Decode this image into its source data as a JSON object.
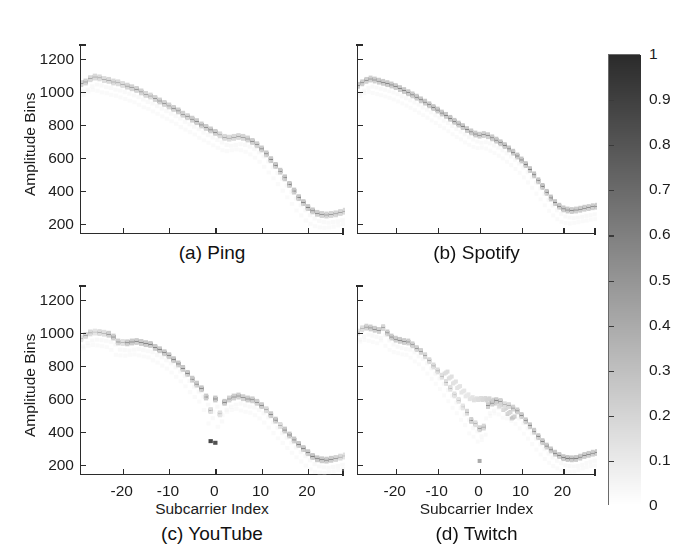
{
  "figure": {
    "width": 682,
    "height": 559,
    "background": "#ffffff",
    "ink_color": "#1c1c1c"
  },
  "panels": [
    {
      "id": "a",
      "caption": "(a) Ping",
      "ylabel": "Amplitude Bins",
      "xlabel": "",
      "show_ytick_labels": true,
      "show_xtick_labels": false
    },
    {
      "id": "b",
      "caption": "(b) Spotify",
      "ylabel": "",
      "xlabel": "",
      "show_ytick_labels": false,
      "show_xtick_labels": false
    },
    {
      "id": "c",
      "caption": "(c) YouTube",
      "ylabel": "Amplitude Bins",
      "xlabel": "Subcarrier Index",
      "show_ytick_labels": true,
      "show_xtick_labels": true
    },
    {
      "id": "d",
      "caption": "(d) Twitch",
      "ylabel": "",
      "xlabel": "Subcarrier Index",
      "show_ytick_labels": false,
      "show_xtick_labels": true
    }
  ],
  "colorbar": {
    "min_label": "0",
    "max_label": "1",
    "low_color": "#ffffff",
    "high_color": "#2f2f2f",
    "ticks": [
      "1",
      "0.9",
      "0.8",
      "0.7",
      "0.6",
      "0.5",
      "0.4",
      "0.3",
      "0.2",
      "0.1",
      "0"
    ],
    "tick_values": [
      1,
      0.9,
      0.8,
      0.7,
      0.6,
      0.5,
      0.4,
      0.3,
      0.2,
      0.1,
      0
    ]
  },
  "chart_data": {
    "type": "heatmap",
    "title": "",
    "xlabel": "Subcarrier Index",
    "ylabel": "Amplitude Bins",
    "xlim": [
      -29,
      28
    ],
    "ylim": [
      140,
      1290
    ],
    "xticks": [
      -20,
      -10,
      0,
      10,
      20
    ],
    "xticklabels": [
      "-20",
      "-10",
      "0",
      "10",
      "20"
    ],
    "yticks": [
      200,
      400,
      600,
      800,
      1000,
      1200
    ],
    "yticklabels": [
      "200",
      "400",
      "600",
      "800",
      "1000",
      "1200"
    ],
    "grid": false,
    "colormap": "gray-reversed",
    "clim": [
      0,
      1
    ],
    "colorbar_label": "",
    "legend_position": "right-colorbar",
    "panels": [
      {
        "id": "a",
        "name": "Ping",
        "x": [
          -29,
          -28,
          -27,
          -26,
          -25,
          -24,
          -23,
          -22,
          -21,
          -20,
          -19,
          -18,
          -17,
          -16,
          -15,
          -14,
          -13,
          -12,
          -11,
          -10,
          -9,
          -8,
          -7,
          -6,
          -5,
          -4,
          -3,
          -2,
          -1,
          0,
          1,
          2,
          3,
          4,
          5,
          6,
          7,
          8,
          9,
          10,
          11,
          12,
          13,
          14,
          15,
          16,
          17,
          18,
          19,
          20,
          21,
          22,
          23,
          24,
          25,
          26,
          27,
          28
        ],
        "y": [
          1050,
          1060,
          1080,
          1090,
          1085,
          1075,
          1070,
          1060,
          1055,
          1045,
          1035,
          1025,
          1015,
          1000,
          985,
          975,
          960,
          945,
          930,
          915,
          900,
          885,
          865,
          850,
          835,
          820,
          800,
          785,
          770,
          755,
          740,
          725,
          720,
          725,
          730,
          725,
          715,
          700,
          680,
          655,
          625,
          590,
          555,
          520,
          480,
          440,
          400,
          360,
          330,
          300,
          280,
          265,
          258,
          255,
          258,
          262,
          270,
          278
        ],
        "intensity": [
          0.72,
          0.7,
          0.62,
          0.6,
          0.58,
          0.55,
          0.62,
          0.6,
          0.58,
          0.55,
          0.68,
          0.7,
          0.72,
          0.7,
          0.65,
          0.62,
          0.72,
          0.75,
          0.72,
          0.7,
          0.75,
          0.78,
          0.75,
          0.72,
          0.8,
          0.82,
          0.8,
          0.78,
          0.82,
          0.8,
          0.62,
          0.6,
          0.58,
          0.6,
          0.62,
          0.66,
          0.72,
          0.78,
          0.8,
          0.82,
          0.85,
          0.88,
          0.86,
          0.88,
          0.9,
          0.88,
          0.9,
          0.88,
          0.86,
          0.88,
          0.86,
          0.8,
          0.72,
          0.7,
          0.68,
          0.66,
          0.64,
          0.62
        ]
      },
      {
        "id": "b",
        "name": "Spotify",
        "x": [
          -29,
          -28,
          -27,
          -26,
          -25,
          -24,
          -23,
          -22,
          -21,
          -20,
          -19,
          -18,
          -17,
          -16,
          -15,
          -14,
          -13,
          -12,
          -11,
          -10,
          -9,
          -8,
          -7,
          -6,
          -5,
          -4,
          -3,
          -2,
          -1,
          0,
          1,
          2,
          3,
          4,
          5,
          6,
          7,
          8,
          9,
          10,
          11,
          12,
          13,
          14,
          15,
          16,
          17,
          18,
          19,
          20,
          21,
          22,
          23,
          24,
          25,
          26,
          27,
          28
        ],
        "y": [
          1040,
          1055,
          1070,
          1078,
          1072,
          1065,
          1058,
          1050,
          1042,
          1032,
          1020,
          1008,
          995,
          982,
          968,
          952,
          938,
          922,
          905,
          890,
          872,
          858,
          840,
          822,
          805,
          790,
          772,
          758,
          745,
          738,
          742,
          735,
          722,
          708,
          692,
          675,
          655,
          635,
          612,
          588,
          560,
          530,
          498,
          462,
          428,
          392,
          358,
          330,
          308,
          292,
          285,
          282,
          285,
          290,
          296,
          300,
          305,
          308
        ],
        "intensity": [
          0.85,
          0.82,
          0.78,
          0.76,
          0.8,
          0.82,
          0.84,
          0.86,
          0.85,
          0.84,
          0.86,
          0.88,
          0.86,
          0.85,
          0.87,
          0.88,
          0.86,
          0.88,
          0.9,
          0.88,
          0.87,
          0.88,
          0.9,
          0.88,
          0.86,
          0.88,
          0.86,
          0.84,
          0.85,
          0.8,
          0.76,
          0.8,
          0.84,
          0.86,
          0.88,
          0.9,
          0.88,
          0.9,
          0.92,
          0.9,
          0.92,
          0.9,
          0.92,
          0.9,
          0.92,
          0.9,
          0.92,
          0.9,
          0.88,
          0.86,
          0.84,
          0.82,
          0.8,
          0.82,
          0.8,
          0.78,
          0.8,
          0.78
        ]
      },
      {
        "id": "c",
        "name": "YouTube",
        "x": [
          -29,
          -28,
          -27,
          -26,
          -25,
          -24,
          -23,
          -22,
          -21,
          -20,
          -19,
          -18,
          -17,
          -16,
          -15,
          -14,
          -13,
          -12,
          -11,
          -10,
          -9,
          -8,
          -7,
          -6,
          -5,
          -4,
          -3,
          -2,
          -1,
          0,
          1,
          2,
          3,
          4,
          5,
          6,
          7,
          8,
          9,
          10,
          11,
          12,
          13,
          14,
          15,
          16,
          17,
          18,
          19,
          20,
          21,
          22,
          23,
          24,
          25,
          26,
          27,
          28
        ],
        "y": [
          965,
          985,
          1000,
          1005,
          1002,
          998,
          992,
          975,
          945,
          942,
          940,
          945,
          948,
          942,
          935,
          930,
          912,
          898,
          880,
          862,
          838,
          812,
          785,
          755,
          720,
          690,
          662,
          612,
          530,
          600,
          510,
          580,
          600,
          612,
          618,
          608,
          600,
          595,
          580,
          560,
          535,
          505,
          472,
          440,
          412,
          382,
          352,
          325,
          300,
          275,
          252,
          238,
          232,
          230,
          235,
          240,
          248,
          255
        ],
        "intensity": [
          0.45,
          0.62,
          0.58,
          0.42,
          0.55,
          0.52,
          0.78,
          0.8,
          0.76,
          0.5,
          0.82,
          0.84,
          0.8,
          0.82,
          0.86,
          0.88,
          0.86,
          0.88,
          0.86,
          0.88,
          0.9,
          0.88,
          0.86,
          0.88,
          0.86,
          0.84,
          0.88,
          0.86,
          0.55,
          0.88,
          0.48,
          0.86,
          0.72,
          0.8,
          0.78,
          0.76,
          0.82,
          0.8,
          0.78,
          0.82,
          0.6,
          0.84,
          0.86,
          0.55,
          0.86,
          0.88,
          0.86,
          0.88,
          0.86,
          0.88,
          0.9,
          0.88,
          0.86,
          0.84,
          0.82,
          0.68,
          0.58,
          0.48
        ],
        "outlier_points": [
          {
            "x": -1,
            "y": 345,
            "intensity": 0.86
          },
          {
            "x": 0,
            "y": 335,
            "intensity": 0.82
          }
        ]
      },
      {
        "id": "d",
        "name": "Twitch",
        "x": [
          -29,
          -28,
          -27,
          -26,
          -25,
          -24,
          -23,
          -22,
          -21,
          -20,
          -19,
          -18,
          -17,
          -16,
          -15,
          -14,
          -13,
          -12,
          -11,
          -10,
          -9,
          -8,
          -7,
          -6,
          -5,
          -4,
          -3,
          -2,
          -1,
          0,
          1,
          2,
          3,
          4,
          5,
          6,
          7,
          8,
          9,
          10,
          11,
          12,
          13,
          14,
          15,
          16,
          17,
          18,
          19,
          20,
          21,
          22,
          23,
          24,
          25,
          26,
          27,
          28
        ],
        "y": [
          1005,
          1025,
          1035,
          1030,
          1022,
          1015,
          1032,
          1000,
          975,
          962,
          955,
          948,
          945,
          928,
          905,
          888,
          862,
          832,
          800,
          770,
          738,
          700,
          665,
          625,
          592,
          552,
          520,
          470,
          450,
          420,
          430,
          560,
          575,
          590,
          585,
          565,
          560,
          545,
          528,
          500,
          468,
          438,
          405,
          372,
          342,
          315,
          292,
          272,
          258,
          245,
          240,
          238,
          240,
          248,
          258,
          265,
          272,
          276
        ],
        "intensity": [
          0.42,
          0.52,
          0.7,
          0.78,
          0.8,
          0.75,
          0.65,
          0.82,
          0.84,
          0.8,
          0.82,
          0.8,
          0.78,
          0.75,
          0.72,
          0.7,
          0.65,
          0.62,
          0.58,
          0.55,
          0.5,
          0.52,
          0.48,
          0.45,
          0.42,
          0.4,
          0.62,
          0.75,
          0.55,
          0.72,
          0.65,
          0.78,
          0.8,
          0.82,
          0.7,
          0.55,
          0.6,
          0.72,
          0.8,
          0.82,
          0.84,
          0.86,
          0.84,
          0.86,
          0.88,
          0.86,
          0.88,
          0.9,
          0.88,
          0.9,
          0.92,
          0.9,
          0.88,
          0.86,
          0.84,
          0.82,
          0.8,
          0.78
        ],
        "ghost_branch": {
          "x": [
            -8,
            -7,
            -6,
            -5,
            -4,
            -3,
            -2,
            -1,
            0,
            1,
            2,
            3,
            4,
            5,
            6,
            7,
            8
          ],
          "y": [
            760,
            730,
            700,
            672,
            645,
            622,
            605,
            598,
            600,
            600,
            598,
            590,
            578,
            560,
            540,
            515,
            488
          ],
          "intensity": [
            0.18,
            0.16,
            0.15,
            0.14,
            0.13,
            0.12,
            0.14,
            0.16,
            0.18,
            0.2,
            0.22,
            0.24,
            0.22,
            0.2,
            0.22,
            0.25,
            0.3
          ]
        },
        "outlier_points": [
          {
            "x": 0,
            "y": 225,
            "intensity": 0.4
          }
        ]
      }
    ]
  }
}
